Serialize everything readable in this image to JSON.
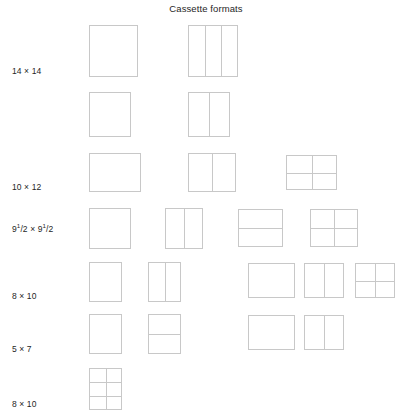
{
  "title": "Cassette formats",
  "colors": {
    "outline": "#c8c8c8",
    "text": "#262626",
    "background": "#ffffff"
  },
  "rows": [
    {
      "label": "14 × 14",
      "label_html": "14 × 14",
      "label_x": 12,
      "label_y": 66,
      "boxes": [
        {
          "name": "box-14x14-plain",
          "x": 89,
          "y": 25,
          "w": 49,
          "h": 52,
          "cols": 1,
          "rows": 1
        },
        {
          "name": "box-14x14-3col",
          "x": 188,
          "y": 25,
          "w": 50,
          "h": 52,
          "cols": 3,
          "rows": 1
        }
      ]
    },
    {
      "label": "",
      "label_html": "",
      "label_x": 12,
      "label_y": 128,
      "boxes": [
        {
          "name": "box-row2-plain",
          "x": 89,
          "y": 92,
          "w": 42,
          "h": 45,
          "cols": 1,
          "rows": 1
        },
        {
          "name": "box-row2-2col",
          "x": 188,
          "y": 92,
          "w": 42,
          "h": 45,
          "cols": 2,
          "rows": 1
        }
      ]
    },
    {
      "label": "10 × 12",
      "label_html": "10 × 12",
      "label_x": 12,
      "label_y": 182,
      "boxes": [
        {
          "name": "box-10x12-plain",
          "x": 89,
          "y": 153,
          "w": 52,
          "h": 39,
          "cols": 1,
          "rows": 1
        },
        {
          "name": "box-10x12-2col",
          "x": 188,
          "y": 153,
          "w": 48,
          "h": 39,
          "cols": 2,
          "rows": 1
        },
        {
          "name": "box-10x12-2x2",
          "x": 286,
          "y": 155,
          "w": 51,
          "h": 35,
          "cols": 2,
          "rows": 2
        }
      ]
    },
    {
      "label": "9 1/2 × 9 1/2",
      "label_html": "9<sup>1</sup>/2 × 9<sup>1</sup>/2",
      "label_x": 12,
      "label_y": 224,
      "boxes": [
        {
          "name": "box-9half-plain",
          "x": 89,
          "y": 208,
          "w": 42,
          "h": 41,
          "cols": 1,
          "rows": 1
        },
        {
          "name": "box-9half-2col",
          "x": 165,
          "y": 208,
          "w": 38,
          "h": 41,
          "cols": 2,
          "rows": 1
        },
        {
          "name": "box-9half-2row",
          "x": 238,
          "y": 209,
          "w": 45,
          "h": 38,
          "cols": 1,
          "rows": 2
        },
        {
          "name": "box-9half-2x2",
          "x": 310,
          "y": 209,
          "w": 48,
          "h": 38,
          "cols": 2,
          "rows": 2
        }
      ]
    },
    {
      "label": "8 × 10",
      "label_html": "8 × 10",
      "label_x": 12,
      "label_y": 291,
      "boxes": [
        {
          "name": "box-8x10a-plain",
          "x": 89,
          "y": 262,
          "w": 33,
          "h": 40,
          "cols": 1,
          "rows": 1
        },
        {
          "name": "box-8x10a-2col",
          "x": 148,
          "y": 262,
          "w": 33,
          "h": 40,
          "cols": 2,
          "rows": 1
        },
        {
          "name": "box-8x10a-wide-plain",
          "x": 248,
          "y": 263,
          "w": 47,
          "h": 35,
          "cols": 1,
          "rows": 1
        },
        {
          "name": "box-8x10a-wide-2col",
          "x": 304,
          "y": 263,
          "w": 40,
          "h": 35,
          "cols": 2,
          "rows": 1
        },
        {
          "name": "box-8x10a-wide-2x2",
          "x": 355,
          "y": 263,
          "w": 40,
          "h": 35,
          "cols": 2,
          "rows": 2
        }
      ]
    },
    {
      "label": "5 × 7",
      "label_html": "5 × 7",
      "label_x": 12,
      "label_y": 344,
      "boxes": [
        {
          "name": "box-5x7-plain",
          "x": 89,
          "y": 314,
          "w": 33,
          "h": 40,
          "cols": 1,
          "rows": 1
        },
        {
          "name": "box-5x7-2row",
          "x": 148,
          "y": 314,
          "w": 33,
          "h": 40,
          "cols": 1,
          "rows": 2
        },
        {
          "name": "box-5x7-wide-plain",
          "x": 248,
          "y": 315,
          "w": 47,
          "h": 35,
          "cols": 1,
          "rows": 1
        },
        {
          "name": "box-5x7-wide-2col",
          "x": 304,
          "y": 315,
          "w": 40,
          "h": 35,
          "cols": 2,
          "rows": 1
        }
      ]
    },
    {
      "label": "8 × 10",
      "label_html": "8 × 10",
      "label_x": 12,
      "label_y": 399,
      "boxes": [
        {
          "name": "box-8x10b-2x3",
          "x": 89,
          "y": 368,
          "w": 33,
          "h": 42,
          "cols": 2,
          "rows": 3
        }
      ]
    }
  ],
  "chart_data": {
    "type": "table",
    "title": "Cassette formats",
    "xlabel": "",
    "ylabel": "",
    "grid": false,
    "legend": "none",
    "categories": [
      "14 × 14",
      "",
      "10 × 12",
      "9 1/2 × 9 1/2",
      "8 × 10",
      "5 × 7",
      "8 × 10"
    ],
    "series": [
      {
        "name": "subdivisions per row (cols x rows)",
        "values": [
          [
            "1x1",
            "3x1"
          ],
          [
            "1x1",
            "2x1"
          ],
          [
            "1x1",
            "2x1",
            "2x2"
          ],
          [
            "1x1",
            "2x1",
            "1x2",
            "2x2"
          ],
          [
            "1x1",
            "2x1",
            "1x1",
            "2x1",
            "2x2"
          ],
          [
            "1x1",
            "1x2",
            "1x1",
            "2x1"
          ],
          [
            "2x3"
          ]
        ]
      },
      {
        "name": "box count per row",
        "values": [
          2,
          2,
          3,
          4,
          5,
          4,
          1
        ]
      }
    ]
  }
}
